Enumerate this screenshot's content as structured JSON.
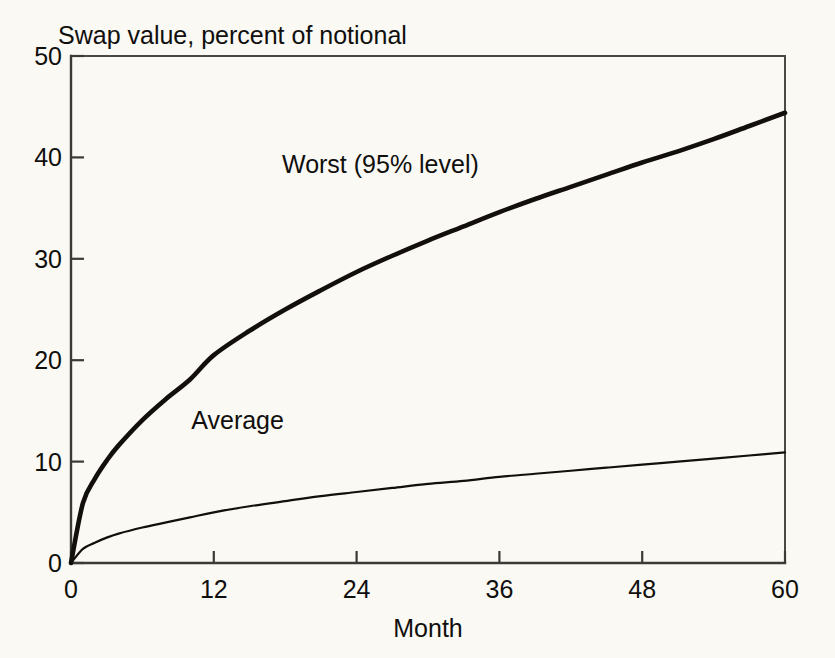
{
  "chart_data": {
    "type": "line",
    "title": "Swap value, percent of notional",
    "xlabel": "Month",
    "ylabel": "",
    "xlim": [
      0,
      60
    ],
    "ylim": [
      0,
      50
    ],
    "grid": false,
    "legend_position": "inline-annotation",
    "x_ticks": [
      "0",
      "12",
      "24",
      "36",
      "48",
      "60"
    ],
    "x_tick_values": [
      0,
      12,
      24,
      36,
      48,
      60
    ],
    "y_ticks": [
      "0",
      "10",
      "20",
      "30",
      "40",
      "50"
    ],
    "y_tick_values": [
      0,
      10,
      20,
      30,
      40,
      50
    ],
    "x": [
      0,
      1,
      2,
      3,
      4,
      6,
      8,
      10,
      12,
      15,
      18,
      21,
      24,
      27,
      30,
      33,
      36,
      39,
      42,
      45,
      48,
      51,
      54,
      57,
      60
    ],
    "series": [
      {
        "name": "Worst (95% level)",
        "label": "Worst (95% level)",
        "style": "thick",
        "values": [
          0.0,
          5.9,
          8.3,
          10.1,
          11.6,
          14.1,
          16.2,
          18.1,
          20.5,
          22.9,
          25.0,
          26.9,
          28.7,
          30.3,
          31.8,
          33.2,
          34.6,
          35.9,
          37.1,
          38.3,
          39.5,
          40.6,
          41.8,
          43.1,
          44.4
        ]
      },
      {
        "name": "Average",
        "label": "Average",
        "style": "thin",
        "values": [
          0.0,
          1.4,
          2.0,
          2.5,
          2.9,
          3.5,
          4.0,
          4.5,
          5.0,
          5.6,
          6.1,
          6.6,
          7.0,
          7.4,
          7.8,
          8.1,
          8.5,
          8.8,
          9.1,
          9.4,
          9.7,
          10.0,
          10.3,
          10.6,
          10.9
        ]
      }
    ],
    "annotations": [
      {
        "text": "Worst (95% level)",
        "x_month": 26.0,
        "y_value": 38.5
      },
      {
        "text": "Average",
        "x_month": 14.0,
        "y_value": 13.2
      }
    ],
    "colors": {
      "line": "#120f0c",
      "axis": "#3a3a36",
      "background": "#faf9f4",
      "text": "#100f0d"
    }
  }
}
